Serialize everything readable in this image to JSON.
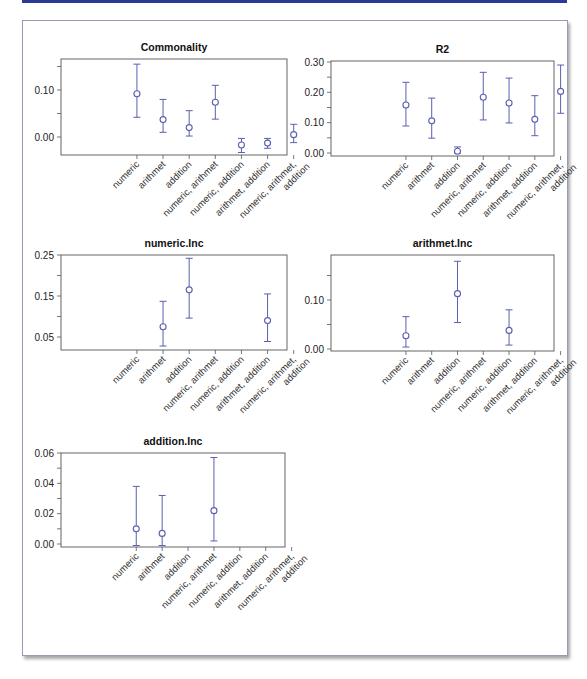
{
  "theme": {
    "topbar_color": "#2b3a96",
    "point_color": "#5a5fb0"
  },
  "chart_data": [
    {
      "type": "scatter",
      "subtype": "point-with-error-bars",
      "title": "Commonality",
      "categories": [
        "numeric",
        "arithmet",
        "addition",
        "numeric, arithmet",
        "numeric, addition",
        "arithmet, addition",
        "numeric, arithmet, addition"
      ],
      "values": [
        0.092,
        0.037,
        0.02,
        0.074,
        -0.017,
        -0.013,
        0.005
      ],
      "lower": [
        0.042,
        0.01,
        0.002,
        0.038,
        -0.033,
        -0.024,
        -0.012
      ],
      "upper": [
        0.155,
        0.08,
        0.056,
        0.11,
        -0.003,
        -0.003,
        0.027
      ],
      "yticks": [
        0.0,
        0.05,
        0.1,
        0.15
      ],
      "ytick_labels": [
        "0.00",
        "",
        "0.10",
        ""
      ],
      "ylim": [
        -0.04,
        0.16
      ],
      "box": {
        "x0": 61,
        "y0": 59,
        "x1": 287,
        "y1": 155
      },
      "yscale": {
        "v0": 0.0,
        "p0": 137,
        "v1": 0.1,
        "p1": 90
      }
    },
    {
      "type": "scatter",
      "subtype": "point-with-error-bars",
      "title": "R2",
      "categories": [
        "numeric",
        "arithmet",
        "addition",
        "numeric, arithmet",
        "numeric, addition",
        "arithmet, addition",
        "numeric, arithmet, addition"
      ],
      "values": [
        0.158,
        0.106,
        0.006,
        0.184,
        0.165,
        0.111,
        0.203
      ],
      "lower": [
        0.089,
        0.049,
        0.0,
        0.109,
        0.099,
        0.057,
        0.131
      ],
      "upper": [
        0.233,
        0.181,
        0.02,
        0.266,
        0.247,
        0.189,
        0.29
      ],
      "yticks": [
        0.0,
        0.05,
        0.1,
        0.15,
        0.2,
        0.25,
        0.3
      ],
      "ytick_labels": [
        "0.00",
        "",
        "0.10",
        "",
        "0.20",
        "",
        "0.30"
      ],
      "ylim": [
        -0.01,
        0.3
      ],
      "box": {
        "x0": 331,
        "y0": 61,
        "x1": 554,
        "y1": 156
      },
      "yscale": {
        "v0": 0.0,
        "p0": 153,
        "v1": 0.3,
        "p1": 62
      }
    },
    {
      "type": "scatter",
      "subtype": "point-with-error-bars",
      "title": "numeric.Inc",
      "categories": [
        "numeric",
        "arithmet",
        "addition",
        "numeric, arithmet",
        "numeric, addition",
        "arithmet, addition",
        "numeric, arithmet, addition"
      ],
      "values": [
        null,
        0.075,
        0.165,
        null,
        null,
        0.09,
        null
      ],
      "lower": [
        null,
        0.028,
        0.096,
        null,
        null,
        0.039,
        null
      ],
      "upper": [
        null,
        0.137,
        0.242,
        null,
        null,
        0.155,
        null
      ],
      "yticks": [
        0.05,
        0.1,
        0.15,
        0.2,
        0.25
      ],
      "ytick_labels": [
        "0.05",
        "",
        "0.15",
        "",
        "0.25"
      ],
      "ylim": [
        0.02,
        0.25
      ],
      "box": {
        "x0": 61,
        "y0": 255,
        "x1": 287,
        "y1": 350
      },
      "yscale": {
        "v0": 0.05,
        "p0": 337,
        "v1": 0.25,
        "p1": 255
      }
    },
    {
      "type": "scatter",
      "subtype": "point-with-error-bars",
      "title": "arithmet.Inc",
      "categories": [
        "numeric",
        "arithmet",
        "addition",
        "numeric, arithmet",
        "numeric, addition",
        "arithmet, addition",
        "numeric, arithmet, addition"
      ],
      "values": [
        0.027,
        null,
        0.113,
        null,
        0.038,
        null,
        null
      ],
      "lower": [
        0.004,
        null,
        0.054,
        null,
        0.008,
        null,
        null
      ],
      "upper": [
        0.066,
        null,
        0.179,
        null,
        0.08,
        null,
        null
      ],
      "yticks": [
        0.0,
        0.05,
        0.1,
        0.15
      ],
      "ytick_labels": [
        "0.00",
        "",
        "0.10",
        ""
      ],
      "ylim": [
        -0.005,
        0.185
      ],
      "box": {
        "x0": 331,
        "y0": 255,
        "x1": 554,
        "y1": 351
      },
      "yscale": {
        "v0": 0.0,
        "p0": 349,
        "v1": 0.1,
        "p1": 300
      }
    },
    {
      "type": "scatter",
      "subtype": "point-with-error-bars",
      "title": "addition.Inc",
      "categories": [
        "numeric",
        "arithmet",
        "addition",
        "numeric, arithmet",
        "numeric, addition",
        "arithmet, addition",
        "numeric, arithmet, addition"
      ],
      "values": [
        0.01,
        0.007,
        null,
        0.022,
        null,
        null,
        null
      ],
      "lower": [
        -0.001,
        -0.001,
        null,
        0.002,
        null,
        null,
        null
      ],
      "upper": [
        0.038,
        0.032,
        null,
        0.057,
        null,
        null,
        null
      ],
      "yticks": [
        0.0,
        0.01,
        0.02,
        0.03,
        0.04,
        0.05,
        0.06
      ],
      "ytick_labels": [
        "0.00",
        "",
        "0.02",
        "",
        "0.04",
        "",
        "0.06"
      ],
      "ylim": [
        -0.001,
        0.06
      ],
      "box": {
        "x0": 61,
        "y0": 453,
        "x1": 285,
        "y1": 547
      },
      "yscale": {
        "v0": 0.0,
        "p0": 544,
        "v1": 0.06,
        "p1": 453
      }
    }
  ]
}
